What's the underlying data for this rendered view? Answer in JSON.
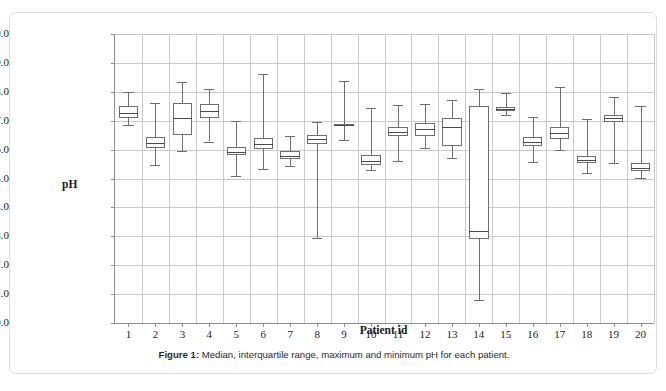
{
  "figure": {
    "caption_label": "Figure 1:",
    "caption_text": " Median, interquartile range, maximum and minimum pH for each patient."
  },
  "chart_data": {
    "type": "box",
    "title": "",
    "xlabel": "Patient id",
    "ylabel": "pH",
    "ylim": [
      0.0,
      10.0
    ],
    "ytick_step": 1.0,
    "grid": true,
    "legend": "none",
    "categories": [
      "1",
      "2",
      "3",
      "4",
      "5",
      "6",
      "7",
      "8",
      "9",
      "10",
      "11",
      "12",
      "13",
      "14",
      "15",
      "16",
      "17",
      "18",
      "19",
      "20"
    ],
    "ytick_labels": [
      "10.0",
      "9.0",
      "8.0",
      "7.0",
      "6.0",
      "5.0",
      "4.0",
      "3.0",
      "2.0",
      "1.0",
      "0.0"
    ],
    "boxes": [
      {
        "id": "1",
        "min": 6.85,
        "q1": 7.08,
        "median": 7.28,
        "q3": 7.52,
        "max": 8.0
      },
      {
        "id": "2",
        "min": 5.45,
        "q1": 6.05,
        "median": 6.22,
        "q3": 6.42,
        "max": 7.6
      },
      {
        "id": "3",
        "min": 5.95,
        "q1": 6.52,
        "median": 7.1,
        "q3": 7.62,
        "max": 8.35
      },
      {
        "id": "4",
        "min": 6.28,
        "q1": 7.08,
        "median": 7.33,
        "q3": 7.58,
        "max": 8.1
      },
      {
        "id": "5",
        "min": 5.08,
        "q1": 5.8,
        "median": 5.9,
        "q3": 6.08,
        "max": 7.0
      },
      {
        "id": "6",
        "min": 5.32,
        "q1": 6.02,
        "median": 6.18,
        "q3": 6.4,
        "max": 8.62
      },
      {
        "id": "7",
        "min": 5.42,
        "q1": 5.68,
        "median": 5.78,
        "q3": 5.95,
        "max": 6.48
      },
      {
        "id": "8",
        "min": 2.95,
        "q1": 6.2,
        "median": 6.35,
        "q3": 6.5,
        "max": 6.95
      },
      {
        "id": "9",
        "min": 6.32,
        "q1": 6.8,
        "median": 6.85,
        "q3": 6.9,
        "max": 8.38
      },
      {
        "id": "10",
        "min": 5.28,
        "q1": 5.48,
        "median": 5.62,
        "q3": 5.82,
        "max": 7.45
      },
      {
        "id": "11",
        "min": 5.62,
        "q1": 6.48,
        "median": 6.62,
        "q3": 6.78,
        "max": 7.55
      },
      {
        "id": "12",
        "min": 6.05,
        "q1": 6.48,
        "median": 6.7,
        "q3": 6.92,
        "max": 7.58
      },
      {
        "id": "13",
        "min": 5.72,
        "q1": 6.12,
        "median": 6.78,
        "q3": 7.08,
        "max": 7.72
      },
      {
        "id": "14",
        "min": 0.78,
        "q1": 2.9,
        "median": 3.18,
        "q3": 7.5,
        "max": 8.08
      },
      {
        "id": "15",
        "min": 7.2,
        "q1": 7.35,
        "median": 7.4,
        "q3": 7.48,
        "max": 7.95
      },
      {
        "id": "16",
        "min": 5.58,
        "q1": 6.12,
        "median": 6.25,
        "q3": 6.42,
        "max": 7.12
      },
      {
        "id": "17",
        "min": 5.98,
        "q1": 6.38,
        "median": 6.58,
        "q3": 6.78,
        "max": 8.15
      },
      {
        "id": "18",
        "min": 5.18,
        "q1": 5.55,
        "median": 5.65,
        "q3": 5.78,
        "max": 7.05
      },
      {
        "id": "19",
        "min": 5.55,
        "q1": 6.95,
        "median": 7.08,
        "q3": 7.18,
        "max": 7.82
      },
      {
        "id": "20",
        "min": 5.02,
        "q1": 5.25,
        "median": 5.38,
        "q3": 5.52,
        "max": 7.5
      }
    ]
  }
}
